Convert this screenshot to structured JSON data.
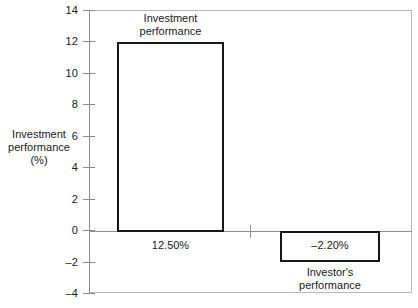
{
  "chart_data": {
    "type": "bar",
    "title": "",
    "xlabel": "",
    "ylabel": "Investment\nperformance\n(%)",
    "ylim": [
      -4,
      14
    ],
    "ytick_step": 2,
    "ytick_labels": [
      "14",
      "12",
      "10",
      "8",
      "6",
      "4",
      "2",
      "0",
      "–2",
      "–4"
    ],
    "ytick_values": [
      14,
      12,
      10,
      8,
      6,
      4,
      2,
      0,
      -2,
      -4
    ],
    "grid": false,
    "legend": "none",
    "categories": [
      "Investment performance",
      "Investor's performance"
    ],
    "values": [
      12.5,
      -2.2
    ],
    "value_labels": [
      "12.50%",
      "–2.20%"
    ],
    "series": [
      {
        "name": "Performance",
        "values": [
          12.5,
          -2.2
        ]
      }
    ],
    "annotations": [
      {
        "name": "bar-1-category-label",
        "text": "Investment\nperformance",
        "position": "above-bar-1"
      },
      {
        "name": "bar-1-value-label",
        "text": "12.50%",
        "position": "below-zero-line-under-bar-1"
      },
      {
        "name": "bar-2-value-label",
        "text": "–2.20%",
        "position": "inside-bar-2"
      },
      {
        "name": "bar-2-category-label",
        "text": "Investor's\nperformance",
        "position": "below-bar-2"
      }
    ],
    "colors": {
      "bar_fill": "#ffffff",
      "bar_stroke": "#171717",
      "axis": "#8d8d8d",
      "frame": "#b9b9b9",
      "text": "#1a1a1a",
      "background": "#ffffff"
    }
  },
  "axis": {
    "y_title": "Investment\nperformance\n(%)",
    "ticks": [
      {
        "label": "14"
      },
      {
        "label": "12"
      },
      {
        "label": "10"
      },
      {
        "label": "8"
      },
      {
        "label": "6"
      },
      {
        "label": "4"
      },
      {
        "label": "2"
      },
      {
        "label": "0"
      },
      {
        "label": "–2"
      },
      {
        "label": "–4"
      }
    ]
  },
  "labels": {
    "bar1_title": "Investment\nperformance",
    "bar1_value": "12.50%",
    "bar2_value": "–2.20%",
    "bar2_title": "Investor's\nperformance"
  }
}
